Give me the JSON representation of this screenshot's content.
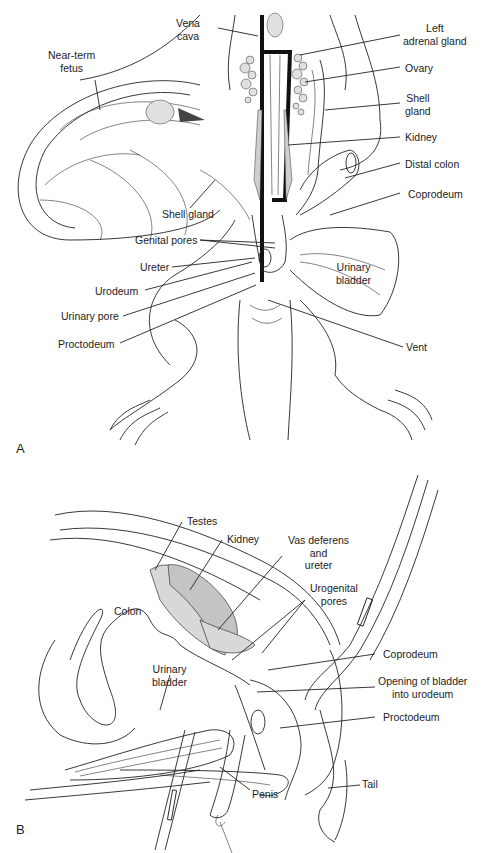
{
  "figure": {
    "panels": [
      {
        "id": "A",
        "label": "A",
        "labels": {
          "vena_cava": [
            "Vena",
            "cava"
          ],
          "near_term_fetus": [
            "Near-term",
            "fetus"
          ],
          "left_adrenal_gland": [
            "Left",
            "adrenal gland"
          ],
          "ovary": "Ovary",
          "shell_gland_right": [
            "Shell",
            "gland"
          ],
          "kidney": "Kidney",
          "distal_colon": "Distal colon",
          "coprodeum": "Coprodeum",
          "shell_gland_left": "Shell gland",
          "genital_pores": "Genital pores",
          "ureter": "Ureter",
          "urodeum": "Urodeum",
          "urinary_pore": "Urinary pore",
          "proctodeum": "Proctodeum",
          "urinary_bladder": [
            "Urinary",
            "bladder"
          ],
          "vent": "Vent"
        }
      },
      {
        "id": "B",
        "label": "B",
        "labels": {
          "testes": "Testes",
          "kidney": "Kidney",
          "vas_deferens_ureter": [
            "Vas deferens",
            "and",
            "ureter"
          ],
          "urogenital_pores": [
            "Urogenital",
            "pores"
          ],
          "colon": "Colon",
          "coprodeum": "Coprodeum",
          "urinary_bladder": [
            "Urinary",
            "bladder"
          ],
          "opening_bladder": [
            "Opening of bladder",
            "into urodeum"
          ],
          "proctodeum": "Proctodeum",
          "penis": "Penis",
          "tail": "Tail"
        }
      }
    ]
  }
}
